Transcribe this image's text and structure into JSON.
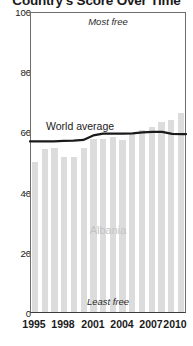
{
  "title": "Country's Score Over Time",
  "annotations": {
    "most_free": "Most free",
    "least_free": "Least free",
    "series_label": "Albania",
    "reference_label": "World average"
  },
  "colors": {
    "bar": "#dcdcdc",
    "line": "#1a1a1a",
    "axis": "#3d3d3d",
    "series_label": "#c2c2c2"
  },
  "chart_data": {
    "type": "bar",
    "title": "Country's Score Over Time",
    "xlabel": "",
    "ylabel": "",
    "ylim": [
      0,
      100
    ],
    "ytick_labels": [
      "0",
      "20",
      "40",
      "60",
      "80",
      "100"
    ],
    "ytick_values": [
      0,
      20,
      40,
      60,
      80,
      100
    ],
    "xtick_labels": [
      "1995",
      "1998",
      "2001",
      "2004",
      "2007",
      "2010"
    ],
    "xtick_values": [
      1995,
      1998,
      2001,
      2004,
      2007,
      2010
    ],
    "grid": false,
    "legend": "in-plot",
    "categories": [
      "1995",
      "1996",
      "1997",
      "1998",
      "1999",
      "2000",
      "2001",
      "2002",
      "2003",
      "2004",
      "2005",
      "2006",
      "2007",
      "2008",
      "2009",
      "2010"
    ],
    "series": [
      {
        "name": "Albania",
        "type": "bar",
        "values": [
          50.0,
          54.0,
          54.5,
          51.5,
          51.5,
          54.5,
          57.5,
          57.5,
          58.0,
          57.0,
          59.0,
          60.5,
          61.5,
          63.0,
          63.7,
          66.0
        ]
      },
      {
        "name": "World average",
        "type": "line",
        "values": [
          57.0,
          57.0,
          57.0,
          57.2,
          57.3,
          57.5,
          59.0,
          59.6,
          59.6,
          59.6,
          59.7,
          60.0,
          60.2,
          60.2,
          59.5,
          59.4
        ]
      }
    ],
    "annotations": [
      {
        "text": "Most free",
        "position": "top-center"
      },
      {
        "text": "Least free",
        "position": "bottom-center"
      },
      {
        "text": "Albania",
        "position": "center"
      },
      {
        "text": "World average",
        "position": "upper-left-of-line"
      }
    ]
  }
}
